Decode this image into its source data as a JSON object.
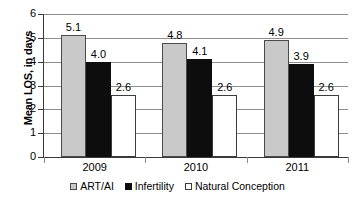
{
  "chart_data": {
    "type": "bar",
    "title": "",
    "xlabel": "",
    "ylabel": "Mean LOS, in days",
    "ylim": [
      0,
      6
    ],
    "ytick_step": 1,
    "yticks": [
      "0",
      "1",
      "2",
      "3",
      "4",
      "5",
      "6"
    ],
    "grid": true,
    "legend_position": "bottom",
    "categories": [
      "2009",
      "2010",
      "2011"
    ],
    "series": [
      {
        "name": "ART/AI",
        "color": "#c9c9c9",
        "border": "#4a4a4a",
        "values": [
          5.1,
          4.8,
          4.9
        ],
        "labels": [
          "5.1",
          "4.8",
          "4.9"
        ]
      },
      {
        "name": "Infertility",
        "color": "#0d0d0d",
        "border": "#0d0d0d",
        "values": [
          4.0,
          4.1,
          3.9
        ],
        "labels": [
          "4.0",
          "4.1",
          "3.9"
        ]
      },
      {
        "name": "Natural Conception",
        "color": "#ffffff",
        "border": "#3c3c3c",
        "values": [
          2.6,
          2.6,
          2.6
        ],
        "labels": [
          "2.6",
          "2.6",
          "2.6"
        ]
      }
    ]
  },
  "axis": {
    "y_title": "Mean LOS, in days"
  },
  "legend": {
    "items": [
      {
        "label": "ART/AI"
      },
      {
        "label": "Infertility"
      },
      {
        "label": "Natural Conception"
      }
    ]
  }
}
